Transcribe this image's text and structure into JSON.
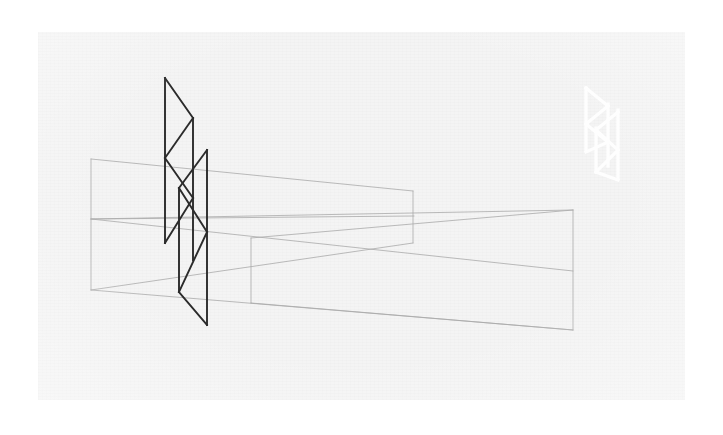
{
  "artwork": {
    "title": "Perspective Lattice Composition",
    "medium": "line drawing on textured paper",
    "canvas": {
      "page_background": "#ffffff",
      "paper_background": "#f4f4f4",
      "paper_x": 38,
      "paper_y": 32,
      "paper_width": 647,
      "paper_height": 368,
      "texture": "fine horizontal paper grain"
    },
    "palette": {
      "dark_stroke": "#2b2b2b",
      "light_stroke": "#a9a9a9",
      "faint_stroke": "#bdbdbd",
      "white_stroke": "#ffffff",
      "paper": "#f4f4f4",
      "page": "#ffffff"
    },
    "stroke_widths": {
      "dark": 1.9,
      "light": 0.8,
      "white": 3.2
    },
    "elements": [
      {
        "name": "left-perspective-trapezoid",
        "kind": "outlined-polygon",
        "stroke": "#a9a9a9",
        "description": "Wide trapezoid opening to the left; vertical left edge, converging right toward a vanishing point.",
        "points": "91,159 412,191 412,243 91,290"
      },
      {
        "name": "left-horizon-line",
        "kind": "line",
        "stroke": "#a9a9a9",
        "description": "Mid horizon line crossing the left trapezoid.",
        "points": "91,219 413,217"
      },
      {
        "name": "middle-perspective-trapezoid",
        "kind": "outlined-polygon",
        "stroke": "#a9a9a9",
        "description": "Lower trapezoid with vertical left edge at x=251 converging right.",
        "points": "251,238 573,210 573,330 251,303"
      },
      {
        "name": "right-perspective-trapezoid",
        "kind": "outlined-polygon",
        "stroke": "#a9a9a9",
        "description": "Right-side wedge whose apex points left, vertical right edge at x=573.",
        "points": "91,219 573,210 573,330 91,290"
      },
      {
        "name": "right-horizon-line",
        "kind": "line",
        "stroke": "#a9a9a9",
        "description": "Long horizon line sweeping from left edge to the right vertical.",
        "points": "91,219 573,271"
      },
      {
        "name": "dark-lattice-motif",
        "kind": "zigzag-lattice",
        "stroke": "#2b2b2b",
        "description": "Central dark zig-zag lattice: two tall verticals crossed by diagonal chevrons forming stacked triangles.",
        "verticals": [
          {
            "x1": 165,
            "y1": 78,
            "x2": 165,
            "y2": 243
          },
          {
            "x1": 193,
            "y1": 118,
            "x2": 193,
            "y2": 260
          },
          {
            "x1": 207,
            "y1": 150,
            "x2": 207,
            "y2": 325
          },
          {
            "x1": 179,
            "y1": 188,
            "x2": 179,
            "y2": 292
          }
        ],
        "diagonals": [
          {
            "x1": 165,
            "y1": 78,
            "x2": 193,
            "y2": 118
          },
          {
            "x1": 193,
            "y1": 118,
            "x2": 165,
            "y2": 158
          },
          {
            "x1": 165,
            "y1": 158,
            "x2": 193,
            "y2": 198
          },
          {
            "x1": 193,
            "y1": 198,
            "x2": 165,
            "y2": 243
          },
          {
            "x1": 207,
            "y1": 150,
            "x2": 179,
            "y2": 188
          },
          {
            "x1": 179,
            "y1": 188,
            "x2": 207,
            "y2": 232
          },
          {
            "x1": 207,
            "y1": 232,
            "x2": 179,
            "y2": 292
          },
          {
            "x1": 179,
            "y1": 292,
            "x2": 207,
            "y2": 325
          }
        ]
      },
      {
        "name": "white-lattice-motif",
        "kind": "zigzag-lattice",
        "stroke": "#ffffff",
        "description": "Faint white echo of the dark lattice, reduced scale, upper-right of the paper.",
        "bounds": {
          "x": 580,
          "y": 84,
          "width": 48,
          "height": 96
        }
      }
    ]
  }
}
